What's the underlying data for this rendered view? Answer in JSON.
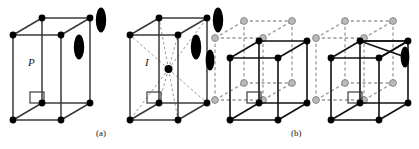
{
  "figure": {
    "captions": {
      "a": "(a)",
      "b": "(b)"
    },
    "labels": {
      "primitive": "P",
      "body_centered": "I"
    },
    "colors": {
      "edge_solid": "#3a3a3a",
      "edge_dark": "#111111",
      "node_black": "#000000",
      "node_gray_fill": "#b9b9b9",
      "node_gray_stroke": "#8a8a8a",
      "dashed_gray": "#9a9a9a",
      "lens_black": "#000000",
      "background": "#ffffff"
    },
    "cells": [
      {
        "id": "cell-p",
        "name": "primitive-cell",
        "label": "P",
        "panel": "(a)",
        "corner_atoms": 8,
        "center_atom": false,
        "lens_markers": 2,
        "has_small_square_marker": true,
        "has_dashed_diagonals": false
      },
      {
        "id": "cell-i",
        "name": "body-centered-cell",
        "label": "I",
        "panel": "(a)",
        "corner_atoms": 8,
        "center_atom": true,
        "lens_markers": 2,
        "has_small_square_marker": true,
        "has_dashed_diagonals": true
      },
      {
        "id": "cell-b1",
        "name": "translated-lattice-cell-1",
        "label": "",
        "panel": "(b)",
        "corner_atoms": 8,
        "center_atom": false,
        "lens_markers": 1,
        "has_small_square_marker": true,
        "has_gray_offset_cell": true
      },
      {
        "id": "cell-b2",
        "name": "translated-lattice-cell-2",
        "label": "",
        "panel": "(b)",
        "corner_atoms": 8,
        "center_atom": false,
        "lens_markers": 1,
        "has_small_square_marker": true,
        "has_gray_offset_cell": true,
        "has_crossed_top_face": true
      }
    ]
  }
}
